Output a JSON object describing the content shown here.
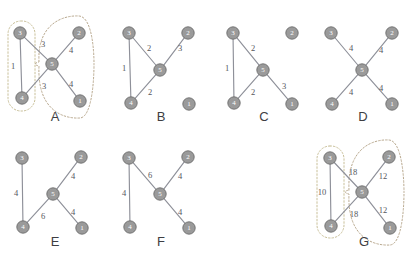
{
  "figure": {
    "title": "",
    "width": 419,
    "height": 255,
    "node_ids": [
      "1",
      "2",
      "3",
      "4",
      "5"
    ]
  },
  "chart_data": {
    "type": "diagram",
    "subtype": "weighted-undirected-graph-panels",
    "legend": [],
    "panels": [
      {
        "id": "A",
        "letter": "A",
        "nodes": [
          {
            "id": "3",
            "x": 20,
            "y": 33
          },
          {
            "id": "2",
            "x": 79,
            "y": 33
          },
          {
            "id": "5",
            "x": 52,
            "y": 64
          },
          {
            "id": "4",
            "x": 22,
            "y": 98
          },
          {
            "id": "1",
            "x": 80,
            "y": 101
          }
        ],
        "edges": [
          {
            "source": "3",
            "target": "4",
            "weight": "1",
            "label_x": 13,
            "label_y": 66
          },
          {
            "source": "3",
            "target": "5",
            "weight": "3",
            "label_x": 43,
            "label_y": 44
          },
          {
            "source": "4",
            "target": "5",
            "weight": "3",
            "label_x": 44,
            "label_y": 86
          },
          {
            "source": "5",
            "target": "2",
            "weight": "4",
            "label_x": 71,
            "label_y": 50
          },
          {
            "source": "5",
            "target": "1",
            "weight": "4",
            "label_x": 71,
            "label_y": 84
          }
        ],
        "enclosures": [
          {
            "type": "rounded-rect",
            "side": "left",
            "x": 8,
            "y": 21,
            "w": 27,
            "h": 90,
            "r": 13
          },
          {
            "type": "loop",
            "side": "right"
          }
        ],
        "letter_x": 55,
        "letter_y": 116
      },
      {
        "id": "B",
        "letter": "B",
        "nodes": [
          {
            "id": "3",
            "x": 129,
            "y": 33
          },
          {
            "id": "2",
            "x": 188,
            "y": 33
          },
          {
            "id": "5",
            "x": 160,
            "y": 70
          },
          {
            "id": "4",
            "x": 131,
            "y": 103
          },
          {
            "id": "1",
            "x": 189,
            "y": 104
          }
        ],
        "edges": [
          {
            "source": "3",
            "target": "4",
            "weight": "1",
            "label_x": 124,
            "label_y": 68
          },
          {
            "source": "3",
            "target": "5",
            "weight": "2",
            "label_x": 149,
            "label_y": 48
          },
          {
            "source": "4",
            "target": "5",
            "weight": "2",
            "label_x": 150,
            "label_y": 92
          },
          {
            "source": "5",
            "target": "2",
            "weight": "3",
            "label_x": 180,
            "label_y": 48
          }
        ],
        "isolated_nodes": [
          "1"
        ],
        "enclosures": [],
        "letter_x": 161,
        "letter_y": 116
      },
      {
        "id": "C",
        "letter": "C",
        "nodes": [
          {
            "id": "3",
            "x": 233,
            "y": 33
          },
          {
            "id": "2",
            "x": 292,
            "y": 33
          },
          {
            "id": "5",
            "x": 263,
            "y": 70
          },
          {
            "id": "4",
            "x": 234,
            "y": 103
          },
          {
            "id": "1",
            "x": 292,
            "y": 104
          }
        ],
        "edges": [
          {
            "source": "3",
            "target": "4",
            "weight": "1",
            "label_x": 227,
            "label_y": 68
          },
          {
            "source": "3",
            "target": "5",
            "weight": "2",
            "label_x": 253,
            "label_y": 48
          },
          {
            "source": "4",
            "target": "5",
            "weight": "2",
            "label_x": 253,
            "label_y": 92
          },
          {
            "source": "5",
            "target": "1",
            "weight": "3",
            "label_x": 284,
            "label_y": 86
          }
        ],
        "isolated_nodes": [
          "2"
        ],
        "enclosures": [],
        "letter_x": 264,
        "letter_y": 116
      },
      {
        "id": "D",
        "letter": "D",
        "nodes": [
          {
            "id": "3",
            "x": 331,
            "y": 33
          },
          {
            "id": "2",
            "x": 392,
            "y": 33
          },
          {
            "id": "5",
            "x": 362,
            "y": 70
          },
          {
            "id": "4",
            "x": 332,
            "y": 104
          },
          {
            "id": "1",
            "x": 392,
            "y": 104
          }
        ],
        "edges": [
          {
            "source": "3",
            "target": "5",
            "weight": "4",
            "label_x": 351,
            "label_y": 48
          },
          {
            "source": "5",
            "target": "2",
            "weight": "4",
            "label_x": 381,
            "label_y": 50
          },
          {
            "source": "4",
            "target": "5",
            "weight": "4",
            "label_x": 351,
            "label_y": 92
          },
          {
            "source": "5",
            "target": "1",
            "weight": "4",
            "label_x": 381,
            "label_y": 88
          }
        ],
        "enclosures": [],
        "letter_x": 363,
        "letter_y": 116
      },
      {
        "id": "E",
        "letter": "E",
        "nodes": [
          {
            "id": "3",
            "x": 22,
            "y": 158
          },
          {
            "id": "2",
            "x": 81,
            "y": 157
          },
          {
            "id": "5",
            "x": 53,
            "y": 194
          },
          {
            "id": "4",
            "x": 23,
            "y": 227
          },
          {
            "id": "1",
            "x": 82,
            "y": 228
          }
        ],
        "edges": [
          {
            "source": "3",
            "target": "4",
            "weight": "4",
            "label_x": 16,
            "label_y": 193
          },
          {
            "source": "4",
            "target": "5",
            "weight": "6",
            "label_x": 43,
            "label_y": 216
          },
          {
            "source": "5",
            "target": "2",
            "weight": "4",
            "label_x": 73,
            "label_y": 176
          },
          {
            "source": "5",
            "target": "1",
            "weight": "4",
            "label_x": 73,
            "label_y": 212
          }
        ],
        "enclosures": [],
        "letter_x": 55,
        "letter_y": 241
      },
      {
        "id": "F",
        "letter": "F",
        "nodes": [
          {
            "id": "3",
            "x": 129,
            "y": 158
          },
          {
            "id": "2",
            "x": 188,
            "y": 157
          },
          {
            "id": "5",
            "x": 160,
            "y": 194
          },
          {
            "id": "4",
            "x": 130,
            "y": 227
          },
          {
            "id": "1",
            "x": 189,
            "y": 228
          }
        ],
        "edges": [
          {
            "source": "3",
            "target": "4",
            "weight": "4",
            "label_x": 124,
            "label_y": 193
          },
          {
            "source": "3",
            "target": "5",
            "weight": "6",
            "label_x": 150,
            "label_y": 175
          },
          {
            "source": "5",
            "target": "2",
            "weight": "4",
            "label_x": 180,
            "label_y": 176
          },
          {
            "source": "5",
            "target": "1",
            "weight": "4",
            "label_x": 180,
            "label_y": 212
          }
        ],
        "enclosures": [],
        "letter_x": 161,
        "letter_y": 241
      },
      {
        "id": "G",
        "letter": "G",
        "nodes": [
          {
            "id": "3",
            "x": 330,
            "y": 158
          },
          {
            "id": "2",
            "x": 389,
            "y": 157
          },
          {
            "id": "5",
            "x": 362,
            "y": 192
          },
          {
            "id": "4",
            "x": 331,
            "y": 226
          },
          {
            "id": "1",
            "x": 390,
            "y": 228
          }
        ],
        "edges": [
          {
            "source": "3",
            "target": "4",
            "weight": "10",
            "label_x": 322,
            "label_y": 192
          },
          {
            "source": "3",
            "target": "5",
            "weight": "18",
            "label_x": 353,
            "label_y": 172
          },
          {
            "source": "4",
            "target": "5",
            "weight": "18",
            "label_x": 354,
            "label_y": 214
          },
          {
            "source": "5",
            "target": "2",
            "weight": "12",
            "label_x": 383,
            "label_y": 176
          },
          {
            "source": "5",
            "target": "1",
            "weight": "12",
            "label_x": 383,
            "label_y": 210
          }
        ],
        "enclosures": [
          {
            "type": "rounded-rect",
            "side": "left",
            "x": 317,
            "y": 146,
            "w": 27,
            "h": 92,
            "r": 13
          },
          {
            "type": "loop",
            "side": "right"
          }
        ],
        "letter_x": 364,
        "letter_y": 241
      }
    ]
  },
  "style": {
    "node_fill": "#9a9a9a",
    "node_stroke": "#6d6d6d",
    "node_label_color": "#ffffff",
    "edge_color": "#8e9099",
    "weight_color": "#54565c",
    "letter_color": "#3e3e42",
    "enclosure_left_color": "#c9c09a",
    "enclosure_right_color": "#b9a98f",
    "background": "#ffffff"
  }
}
